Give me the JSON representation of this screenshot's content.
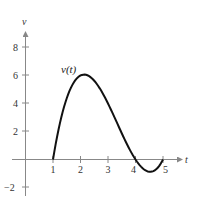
{
  "chart_data": {
    "type": "line",
    "title": "",
    "xlabel": "t",
    "ylabel": "v",
    "xlim": [
      0,
      5.5
    ],
    "ylim": [
      -2.5,
      9
    ],
    "grid": false,
    "x_ticks": [
      1,
      2,
      3,
      4,
      5
    ],
    "y_ticks": [
      -2,
      2,
      4,
      6,
      8
    ],
    "x_tick_labels": [
      "1",
      "2",
      "3",
      "4",
      "5"
    ],
    "y_tick_labels": [
      "−2",
      "2",
      "4",
      "6",
      "8"
    ],
    "series": [
      {
        "name": "v(t)",
        "label": "v(t)",
        "x": [
          1,
          1.5,
          2,
          2.13,
          2.5,
          3,
          3.5,
          4,
          4.25,
          4.53,
          4.75,
          5
        ],
        "values": [
          0,
          4.38,
          6,
          6.06,
          5.25,
          2,
          -1.125,
          0,
          -0.66,
          -0.88,
          -0.69,
          0
        ]
      }
    ],
    "annotations": [
      {
        "text": "v(t)",
        "x": 1.55,
        "y": 6.3
      }
    ]
  }
}
